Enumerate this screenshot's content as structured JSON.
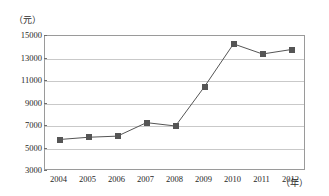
{
  "chart_data": {
    "type": "line",
    "title": "",
    "subtitle": "",
    "xlabel": "年",
    "ylabel": "元",
    "x_unit_label": "（年）",
    "y_unit_label": "（元）",
    "categories": [
      "2004",
      "2005",
      "2006",
      "2007",
      "2008",
      "2009",
      "2010",
      "2011",
      "2012"
    ],
    "values": [
      5800,
      6000,
      6100,
      7300,
      7000,
      10500,
      14300,
      13400,
      13800
    ],
    "series": [
      {
        "name": "",
        "values": [
          5800,
          6000,
          6100,
          7300,
          7000,
          10500,
          14300,
          13400,
          13800
        ]
      }
    ],
    "ylim": [
      3000,
      15000
    ],
    "y_ticks": [
      15000,
      13000,
      11000,
      9000,
      7000,
      5000,
      3000
    ],
    "y_tick_labels": [
      "15000",
      "13000",
      "11000",
      "9000",
      "7000",
      "5000",
      "3000"
    ],
    "x_tick_labels": [
      "2004",
      "2005",
      "2006",
      "2007",
      "2008",
      "2009",
      "2010",
      "2011",
      "2012"
    ],
    "grid": true,
    "grid_axis": "y",
    "legend": "none",
    "marker": "square",
    "line_color": "#555555",
    "marker_color": "#555555",
    "grid_color": "#c9c9c9",
    "frame_color": "#9a9a9a"
  }
}
